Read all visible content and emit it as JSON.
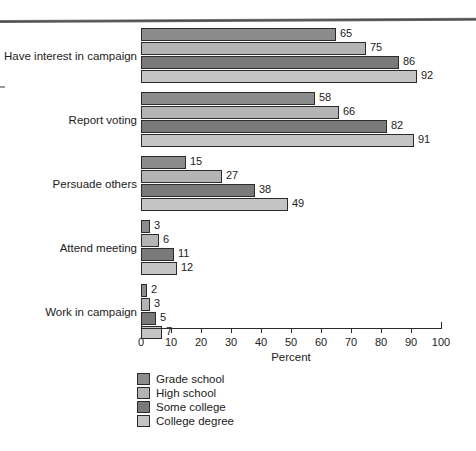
{
  "chart_data": {
    "type": "bar",
    "orientation": "horizontal",
    "title": "",
    "xlabel": "Percent",
    "ylabel": "",
    "xlim": [
      0,
      100
    ],
    "xticks": [
      0,
      10,
      20,
      30,
      40,
      50,
      60,
      70,
      80,
      90,
      100
    ],
    "xtick_labels": [
      "0",
      "10",
      "20",
      "30",
      "40",
      "50",
      "60",
      "70",
      "80",
      "90",
      "100"
    ],
    "grid": false,
    "legend_position": "bottom-center",
    "value_labels": true,
    "categories": [
      "Have interest in campaign",
      "Report voting",
      "Persuade others",
      "Attend meeting",
      "Work in campaign"
    ],
    "series": [
      {
        "name": "Grade school",
        "color": "#8c8c8c",
        "values": [
          65,
          58,
          15,
          3,
          2
        ]
      },
      {
        "name": "High school",
        "color": "#b4b4b4",
        "values": [
          75,
          66,
          27,
          6,
          3
        ]
      },
      {
        "name": "Some college",
        "color": "#7a7a7a",
        "values": [
          86,
          82,
          38,
          11,
          5
        ]
      },
      {
        "name": "College degree",
        "color": "#c4c4c4",
        "values": [
          92,
          91,
          49,
          12,
          7
        ]
      }
    ]
  },
  "legend": {
    "items": [
      {
        "label": "Grade school",
        "color": "#8c8c8c"
      },
      {
        "label": "High school",
        "color": "#b4b4b4"
      },
      {
        "label": "Some college",
        "color": "#7a7a7a"
      },
      {
        "label": "College degree",
        "color": "#c4c4c4"
      }
    ]
  },
  "axis": {
    "x_title": "Percent"
  }
}
